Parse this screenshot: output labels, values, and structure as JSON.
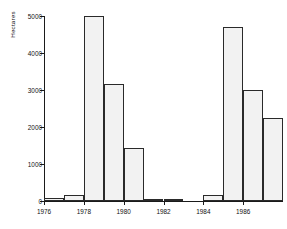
{
  "chart_data": {
    "type": "bar",
    "title": "",
    "subtitle": "",
    "xlabel": "",
    "ylabel": "Hectares",
    "categories": [
      "1976",
      "1977",
      "1978",
      "1979",
      "1980",
      "1981",
      "1982",
      "1983",
      "1984",
      "1985",
      "1986",
      "1987"
    ],
    "values": [
      80,
      150,
      5000,
      3170,
      1430,
      50,
      5,
      0,
      160,
      4700,
      3000,
      2250
    ],
    "series": [
      {
        "name": "Hectares",
        "values": [
          80,
          150,
          5000,
          3170,
          1430,
          50,
          5,
          0,
          160,
          4700,
          3000,
          2250
        ]
      }
    ],
    "ylim": [
      0,
      5000
    ],
    "xlim": [
      1976,
      1988
    ],
    "ytick_values": [
      0,
      1000,
      2000,
      3000,
      4000,
      5000
    ],
    "ytick_labels": [
      "0",
      "1000",
      "2000",
      "3000",
      "4000",
      "5000"
    ],
    "xtick_values": [
      1976,
      1978,
      1980,
      1982,
      1984,
      1986
    ],
    "xtick_labels": [
      "1976",
      "1978",
      "1980",
      "1982",
      "1984",
      "1986"
    ],
    "grid": false,
    "legend": false,
    "legend_position": "none",
    "bar_fill": "#f2f2f2",
    "bar_edge": "#2a2a2a",
    "axis_color": "#1a1a1a",
    "background": "#ffffff",
    "annotations": []
  }
}
